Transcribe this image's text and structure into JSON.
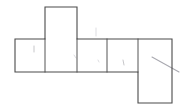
{
  "diagram": {
    "background_color": "#ffffff",
    "edge_color": "#4a4a4a",
    "divider_color": "#555555",
    "sketch_color": "#b9b9bd",
    "canvas": {
      "width": 182,
      "height": 107
    },
    "faces": [
      {
        "name": "face-left",
        "label": "",
        "x": 15,
        "y": 39,
        "w": 30,
        "h": 33
      },
      {
        "name": "face-top",
        "label": "",
        "x": 45,
        "y": 7,
        "w": 32,
        "h": 32
      },
      {
        "name": "face-center-left",
        "label": "",
        "x": 45,
        "y": 39,
        "w": 32,
        "h": 33
      },
      {
        "name": "face-center",
        "label": "",
        "x": 77,
        "y": 39,
        "w": 30,
        "h": 33
      },
      {
        "name": "face-center-right",
        "label": "",
        "x": 107,
        "y": 39,
        "w": 31,
        "h": 33
      },
      {
        "name": "face-bottom-right",
        "label": "",
        "x": 138,
        "y": 39,
        "w": 34,
        "h": 64
      }
    ],
    "outline_path": "M 15 39 L 45 39 L 45 7 L 77 7 L 77 39 L 172 39 L 172 103 L 138 103 L 138 72 L 15 72 Z",
    "dividers": [
      {
        "name": "divider-left-center",
        "x1": 45,
        "y1": 39,
        "x2": 45,
        "y2": 72
      },
      {
        "name": "divider-center-a",
        "x1": 77,
        "y1": 39,
        "x2": 77,
        "y2": 72
      },
      {
        "name": "divider-center-b",
        "x1": 107,
        "y1": 39,
        "x2": 107,
        "y2": 72
      },
      {
        "name": "divider-right",
        "x1": 138,
        "y1": 39,
        "x2": 138,
        "y2": 72
      }
    ],
    "annotations": [
      {
        "name": "tick-above-center",
        "type": "line",
        "x1": 96,
        "y1": 28,
        "x2": 96,
        "y2": 36
      },
      {
        "name": "mark-face-left",
        "type": "line",
        "x1": 34,
        "y1": 46,
        "x2": 34,
        "y2": 52
      },
      {
        "name": "mark-face-center",
        "type": "line",
        "x1": 74,
        "y1": 55,
        "x2": 76,
        "y2": 58
      },
      {
        "name": "mark-face-mid",
        "type": "line",
        "x1": 98,
        "y1": 60,
        "x2": 99,
        "y2": 62
      },
      {
        "name": "mark-face-right",
        "type": "line",
        "x1": 123,
        "y1": 60,
        "x2": 124,
        "y2": 65
      },
      {
        "name": "diagonal-stroke",
        "type": "line",
        "x1": 152,
        "y1": 57,
        "x2": 179,
        "y2": 72
      }
    ]
  }
}
